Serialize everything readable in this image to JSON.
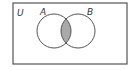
{
  "diagram": {
    "type": "venn",
    "universe_label": "U",
    "sets": [
      {
        "label": "A"
      },
      {
        "label": "B"
      }
    ],
    "shaded_region": "A ∩ B",
    "colors": {
      "stroke": "#555555",
      "shade": "#a9a9a9",
      "background": "#ffffff"
    }
  }
}
